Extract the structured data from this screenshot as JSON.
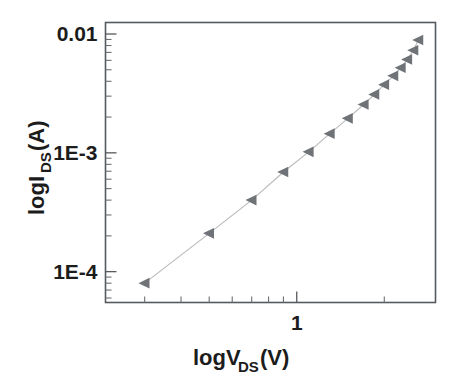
{
  "chart_data": {
    "type": "scatter",
    "title": "",
    "subtitle": "",
    "xlabel": "logV_DS(V)",
    "xlabel_parts": {
      "base": "logV",
      "sub": "DS",
      "unit": "(V)"
    },
    "ylabel": "logI_DS(A)",
    "ylabel_parts": {
      "base": "logI",
      "sub": "DS",
      "unit": "(A)"
    },
    "xscale": "log",
    "yscale": "log",
    "xlim": [
      0.22,
      3.0
    ],
    "ylim": [
      5.5e-05,
      0.0125
    ],
    "grid": false,
    "legend": null,
    "legend_position": "none",
    "x_tick_labels": [
      "1"
    ],
    "x_tick_values": [
      1
    ],
    "x_minor_tick_values": [
      0.3,
      0.4,
      0.5,
      0.6,
      0.7,
      0.8,
      0.9,
      2
    ],
    "y_tick_labels": [
      "0.01",
      "1E-3",
      "1E-4"
    ],
    "y_tick_values": [
      0.01,
      0.001,
      0.0001
    ],
    "y_minor_tick_values": [
      0.009,
      0.008,
      0.007,
      0.006,
      0.005,
      0.004,
      0.003,
      0.002,
      0.0009,
      0.0008,
      0.0007,
      0.0006,
      0.0005,
      0.0004,
      0.0003,
      0.0002,
      9e-05,
      8e-05,
      7e-05,
      6e-05
    ],
    "marker_style": "left-triangle",
    "marker_color": "#6f7377",
    "line_color": "#b9b9b9",
    "series": [
      {
        "name": "IDS vs VDS",
        "x": [
          0.3,
          0.5,
          0.7,
          0.9,
          1.1,
          1.3,
          1.5,
          1.7,
          1.85,
          2.0,
          2.15,
          2.28,
          2.4,
          2.52,
          2.62
        ],
        "y": [
          8e-05,
          0.00021,
          0.0004,
          0.00069,
          0.00102,
          0.00145,
          0.00195,
          0.00255,
          0.0031,
          0.00375,
          0.00445,
          0.0052,
          0.0061,
          0.0073,
          0.0089
        ]
      }
    ]
  },
  "figure": {
    "background": "#ffffff",
    "frame_color": "#555a5e"
  }
}
